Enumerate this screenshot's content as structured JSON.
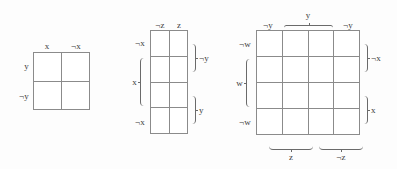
{
  "figure": {
    "type": "venn-karnaugh-diagrams",
    "background_color": "#fdfdfd",
    "line_color": "#8b8b8b",
    "text_color": "#3d3d3d",
    "diagrams": [
      {
        "id": "diagram-1",
        "name": "two-variable-grid",
        "columns": 2,
        "rows": 4,
        "cells": 4,
        "grid_rows": 2,
        "top_labels": [
          "x",
          "¬x"
        ],
        "left_labels": [
          "y",
          "¬y"
        ],
        "right_labels": [],
        "bottom_labels": []
      },
      {
        "id": "diagram-2",
        "name": "three-variable-grid",
        "columns": 2,
        "grid_rows": 4,
        "cells": 8,
        "top_labels": [
          "¬z",
          "z"
        ],
        "left_labels": [
          "¬x",
          "x",
          "¬x"
        ],
        "right_labels": [
          "¬y",
          "y"
        ],
        "bottom_labels": []
      },
      {
        "id": "diagram-3",
        "name": "four-variable-grid",
        "columns": 4,
        "grid_rows": 4,
        "cells": 16,
        "top_labels": [
          "¬y",
          "y",
          "¬y"
        ],
        "left_labels": [
          "¬w",
          "w",
          "¬w"
        ],
        "right_labels": [
          "¬x",
          "x"
        ],
        "bottom_labels": [
          "z",
          "¬z"
        ]
      }
    ]
  },
  "labels": {
    "d1_top_x": "x",
    "d1_top_nx": "¬x",
    "d1_left_y": "y",
    "d1_left_ny": "¬y",
    "d2_top_nz": "¬z",
    "d2_top_z": "z",
    "d2_left_nx_top": "¬x",
    "d2_left_x": "x",
    "d2_left_nx_bottom": "¬x",
    "d2_right_ny": "¬y",
    "d2_right_y": "y",
    "d3_top_ny_left": "¬y",
    "d3_top_y": "y",
    "d3_top_ny_right": "¬y",
    "d3_left_nw_top": "¬w",
    "d3_left_w": "w",
    "d3_left_nw_bottom": "¬w",
    "d3_right_nx": "¬x",
    "d3_right_x": "x",
    "d3_bottom_z": "z",
    "d3_bottom_nz": "¬z"
  }
}
